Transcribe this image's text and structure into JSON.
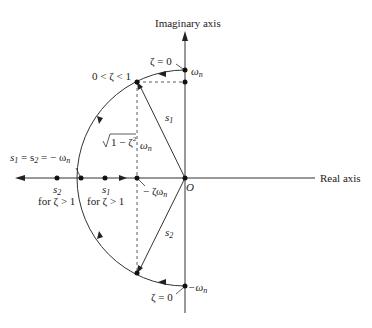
{
  "diagram": {
    "axes": {
      "imaginary_label": "Imaginary axis",
      "real_label": "Real axis",
      "origin_label": "O"
    },
    "labels": {
      "zeta_zero_top": "ζ = 0",
      "zeta_zero_bottom": "ζ = 0",
      "omega_n": "ω",
      "omega_n_sub": "n",
      "neg_omega_n": "−ω",
      "neg_omega_n_sub": "n",
      "underdamped": "0 < ζ < 1",
      "s1": "s",
      "s1_sub": "1",
      "s2": "s",
      "s2_sub": "2",
      "sqrt_term": "1 − ζ",
      "sqrt_exp": "2",
      "sqrt_omega": "ω",
      "sqrt_omega_sub": "n",
      "critical": "s",
      "critical_eq": " = s",
      "critical_val": " = − ω",
      "critical_sub1": "1",
      "critical_sub2": "2",
      "critical_sub3": "n",
      "neg_zeta_omega": "− ζω",
      "neg_zeta_omega_sub": "n",
      "s2_real": "s",
      "s2_real_sub": "2",
      "s2_real_cond": "for ζ > 1",
      "s1_real": "s",
      "s1_real_sub": "1",
      "s1_real_cond": "for ζ > 1"
    },
    "colors": {
      "line": "#333333",
      "background": "#ffffff"
    }
  }
}
